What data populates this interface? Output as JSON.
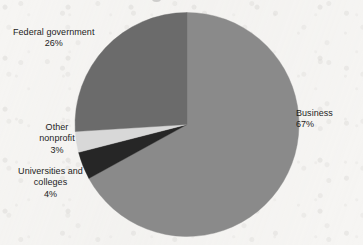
{
  "page": {
    "background_color": "#f6f5f3",
    "width": 363,
    "height": 245
  },
  "chart_data": {
    "type": "pie",
    "title": "",
    "subtitle": "",
    "xlabel": "",
    "ylabel": "",
    "grid": false,
    "legend_position": "none",
    "labels_position": "outside-callout-free",
    "start_angle_deg": 0,
    "direction": "clockwise",
    "center": {
      "x": 187,
      "y": 124.5
    },
    "radius": 112,
    "categories": [
      "Business",
      "Universities and colleges",
      "Other nonprofit",
      "Federal government"
    ],
    "values": [
      67,
      4,
      3,
      26
    ],
    "value_unit": "%",
    "slices": [
      {
        "name": "Business",
        "label_line1": "Business",
        "label_line2": "67%",
        "value": 67,
        "percent_text": "67%",
        "color": "#8a8a8a",
        "start_deg": 0,
        "end_deg": 241.2
      },
      {
        "name": "Universities and colleges",
        "label_line1": "Universities and",
        "label_line2": "colleges",
        "label_line3": "4%",
        "value": 4,
        "percent_text": "4%",
        "color": "#262626",
        "start_deg": 241.2,
        "end_deg": 255.6
      },
      {
        "name": "Other nonprofit",
        "label_line1": "Other",
        "label_line2": "nonprofit",
        "label_line3": "3%",
        "value": 3,
        "percent_text": "3%",
        "color": "#d8d8d8",
        "start_deg": 255.6,
        "end_deg": 266.4
      },
      {
        "name": "Federal government",
        "label_line1": "Federal government",
        "label_line2": "26%",
        "value": 26,
        "percent_text": "26%",
        "color": "#6b6b6b",
        "start_deg": 266.4,
        "end_deg": 360
      }
    ]
  },
  "labels": {
    "business": {
      "line1": "Business",
      "line2": "67%"
    },
    "federal_government": {
      "line1": "Federal government",
      "line2": "26%"
    },
    "other_nonprofit": {
      "line1": "Other",
      "line2": "nonprofit",
      "line3": "3%"
    },
    "universities_and_colleges": {
      "line1": "Universities and",
      "line2": "colleges",
      "line3": "4%"
    }
  }
}
